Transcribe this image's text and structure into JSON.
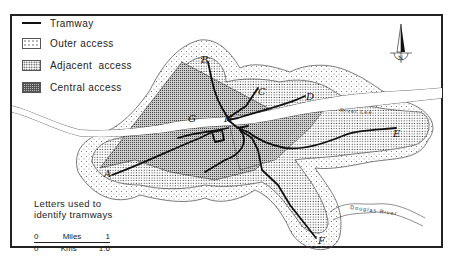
{
  "legend": {
    "items": [
      {
        "label": "Tramway",
        "symbol": "line"
      },
      {
        "label": "Outer access",
        "symbol": "outer"
      },
      {
        "label": "Adjacent  access",
        "symbol": "adjacent"
      },
      {
        "label": "Central access",
        "symbol": "central"
      }
    ]
  },
  "note": {
    "line1": "Letters used to",
    "line2": "identify tramways"
  },
  "scale": {
    "miles_label": "Miles",
    "miles_start": "0",
    "miles_end": "1",
    "kms_label": "Kms",
    "kms_start": "0",
    "kms_end": "1.6"
  },
  "north_arrow": {
    "label": "N"
  },
  "rivers": {
    "lee": "River Lee",
    "douglas": "Douglas River"
  },
  "tramway_labels": {
    "A": "A",
    "B": "B",
    "C": "C",
    "D": "D",
    "E": "E",
    "F": "F",
    "G": "G",
    "H": "H"
  },
  "colors": {
    "ink": "#111111",
    "frame": "#222222",
    "central_fill": "#b8b8b8",
    "background": "#ffffff"
  }
}
